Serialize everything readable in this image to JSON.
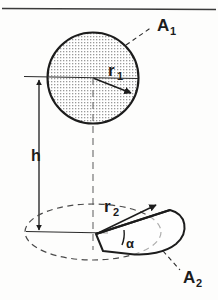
{
  "figure": {
    "kind": "technical-diagram",
    "background_color": "#fdfdfc",
    "ink_color": "#1c1c1c",
    "stipple_color": "#9a9a9a",
    "top_rule": {
      "present": true,
      "color": "#3a3a3a"
    },
    "upper_shape": {
      "name": "circle",
      "area_label": "A",
      "area_subscript": "1",
      "radius_label": "r",
      "radius_subscript": "1",
      "fill": "stipple",
      "outline": "solid",
      "center_x": 93,
      "center_y": 78,
      "radius_px": 46
    },
    "lower_shape": {
      "name": "ellipse-with-sector",
      "area_label": "A",
      "area_subscript": "2",
      "radius_label": "r",
      "radius_subscript": "2",
      "angle_label": "α",
      "ellipse_outline": "dashed",
      "sector_outline": "solid",
      "center_x": 93,
      "center_y": 232,
      "rx_px": 68,
      "ry_px": 28
    },
    "height_dimension": {
      "label": "h",
      "style": "double-headed-arrow",
      "x_px": 39,
      "top_y": 78,
      "bottom_y": 232
    },
    "axis": {
      "style": "dash-dot-vertical",
      "x_px": 93,
      "top_y": 78,
      "bottom_y": 248
    }
  }
}
